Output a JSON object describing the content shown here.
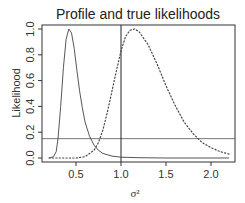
{
  "chart_data": {
    "type": "line",
    "title": "Profile and true likelihoods",
    "xlabel": "σ²",
    "ylabel": "Likelihood",
    "xlim": [
      0.12,
      2.27
    ],
    "ylim": [
      -0.03,
      1.03
    ],
    "xticks": [
      0.5,
      1.0,
      1.5,
      2.0
    ],
    "xtick_labels": [
      "0.5",
      "1.0",
      "1.5",
      "2.0"
    ],
    "yticks": [
      0.0,
      0.2,
      0.4,
      0.6,
      0.8,
      1.0
    ],
    "ytick_labels": [
      "0.0",
      "0.2",
      "0.4",
      "0.6",
      "0.8",
      "1.0"
    ],
    "grid": false,
    "legend": null,
    "series": [
      {
        "name": "profile likelihood",
        "style": "solid",
        "x": [
          0.2,
          0.25,
          0.28,
          0.3,
          0.33,
          0.36,
          0.39,
          0.42,
          0.45,
          0.48,
          0.51,
          0.54,
          0.57,
          0.6,
          0.65,
          0.7,
          0.75,
          0.8,
          0.9,
          1.0,
          1.2,
          1.5,
          2.0,
          2.2
        ],
        "y": [
          0.0,
          0.01,
          0.05,
          0.15,
          0.4,
          0.7,
          0.92,
          1.0,
          0.97,
          0.85,
          0.68,
          0.52,
          0.39,
          0.28,
          0.17,
          0.1,
          0.06,
          0.035,
          0.015,
          0.006,
          0.002,
          0.0,
          0.0,
          0.0
        ]
      },
      {
        "name": "true likelihood",
        "style": "dotted",
        "x": [
          0.2,
          0.4,
          0.5,
          0.6,
          0.7,
          0.75,
          0.8,
          0.85,
          0.9,
          0.95,
          1.0,
          1.05,
          1.1,
          1.15,
          1.2,
          1.3,
          1.4,
          1.5,
          1.6,
          1.7,
          1.8,
          1.9,
          2.0,
          2.1,
          2.2
        ],
        "y": [
          0.0,
          0.0,
          0.0,
          0.01,
          0.06,
          0.12,
          0.22,
          0.36,
          0.52,
          0.68,
          0.83,
          0.94,
          0.99,
          1.0,
          0.98,
          0.88,
          0.73,
          0.56,
          0.41,
          0.28,
          0.19,
          0.12,
          0.08,
          0.05,
          0.03
        ]
      }
    ],
    "reference_lines": [
      {
        "orientation": "horizontal",
        "value": 0.15
      },
      {
        "orientation": "vertical",
        "value": 1.0
      }
    ]
  }
}
